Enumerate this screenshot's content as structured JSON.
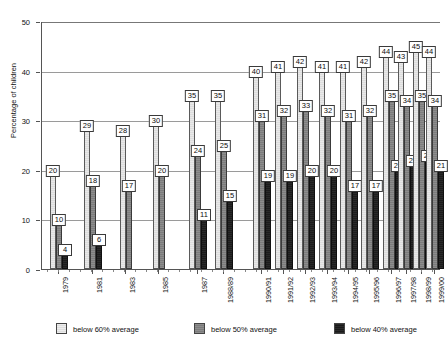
{
  "chart_data": {
    "type": "bar",
    "title": "",
    "xlabel": "",
    "ylabel": "Percentage of children",
    "ylim": [
      0,
      50
    ],
    "yticks": [
      0,
      10,
      20,
      30,
      40,
      50
    ],
    "grid": true,
    "legend_position": "bottom",
    "categories": [
      "1979",
      "1981",
      "1983",
      "1985",
      "1987",
      "1988/89",
      "1990/91",
      "1991/92",
      "1992/93",
      "1993/94",
      "1994/95",
      "1995/96",
      "1996/97",
      "1997/98",
      "1998/99",
      "1999/00"
    ],
    "series": [
      {
        "name": "below 60% average",
        "color": "#e4e4e4",
        "values": [
          20,
          29,
          28,
          30,
          35,
          35,
          40,
          41,
          42,
          41,
          41,
          42,
          44,
          43,
          45,
          44
        ]
      },
      {
        "name": "below 50% average",
        "color": "#828282",
        "values": [
          10,
          18,
          17,
          20,
          24,
          25,
          31,
          32,
          33,
          32,
          31,
          32,
          35,
          34,
          35,
          34
        ]
      },
      {
        "name": "below 40% average",
        "color": "#222222",
        "values": [
          4,
          6,
          null,
          null,
          11,
          15,
          19,
          19,
          20,
          20,
          17,
          17,
          21,
          22,
          23,
          21
        ]
      }
    ]
  },
  "legend": {
    "items": [
      {
        "label": "below 60% average",
        "key": "s60"
      },
      {
        "label": "below 50% average",
        "key": "s50"
      },
      {
        "label": "below 40% average",
        "key": "s40"
      }
    ]
  }
}
